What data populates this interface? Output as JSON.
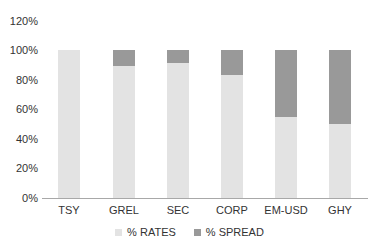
{
  "chart_data": {
    "type": "bar",
    "stacked": true,
    "title": "",
    "xlabel": "",
    "ylabel": "",
    "ylim": [
      0,
      120
    ],
    "y_ticks": [
      "0%",
      "20%",
      "40%",
      "60%",
      "80%",
      "100%",
      "120%"
    ],
    "grid": false,
    "legend_position": "bottom",
    "categories": [
      "TSY",
      "GREL",
      "SEC",
      "CORP",
      "EM-USD",
      "GHY"
    ],
    "series": [
      {
        "name": "% RATES",
        "color": "#e3e3e3",
        "values": [
          100,
          89,
          91,
          83,
          55,
          50
        ]
      },
      {
        "name": "% SPREAD",
        "color": "#999999",
        "values": [
          0,
          11,
          9,
          17,
          45,
          50
        ]
      }
    ]
  },
  "axis": {
    "y_labels": [
      "120%",
      "100%",
      "80%",
      "60%",
      "40%",
      "20%",
      "0%"
    ],
    "x_labels": [
      "TSY",
      "GREL",
      "SEC",
      "CORP",
      "EM-USD",
      "GHY"
    ]
  },
  "legend": {
    "items": [
      {
        "label": "% RATES",
        "color": "#e3e3e3"
      },
      {
        "label": "% SPREAD",
        "color": "#999999"
      }
    ]
  }
}
